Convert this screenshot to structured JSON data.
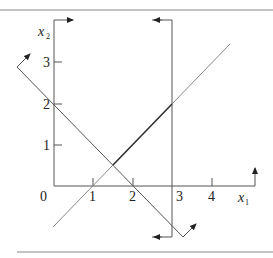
{
  "figure": {
    "type": "linear-programming-feasibility-diagram",
    "axes": {
      "x_label": "x",
      "x_label_sub": "1",
      "y_label": "x",
      "y_label_sub": "2",
      "origin_label": "0",
      "x_ticks": [
        "1",
        "2",
        "3",
        "4"
      ],
      "y_ticks": [
        "1",
        "2",
        "3"
      ]
    },
    "constraints": [
      {
        "name": "x1 + x2 >= 2",
        "points": [
          [
            -1,
            3
          ],
          [
            3.2,
            -1.2
          ]
        ],
        "arrow_side": "upper-right"
      },
      {
        "name": "x1 <= 3",
        "points": [
          [
            3,
            4
          ],
          [
            3,
            -1.2
          ]
        ],
        "arrow_side": "left"
      },
      {
        "name": "x2 >= x1 - 1",
        "points": [
          [
            0,
            -1
          ],
          [
            4.4,
            3.5
          ]
        ],
        "arrow_side": "none"
      },
      {
        "name": "x1 >= 0",
        "arrow_side": "right"
      },
      {
        "name": "x2 >= 0",
        "arrow_side": "up"
      }
    ],
    "highlighted_segment": {
      "from": [
        1.5,
        0.5
      ],
      "to": [
        3,
        2
      ]
    },
    "colors": {
      "line": "#555555",
      "highlight": "#333333",
      "rule": "#888888"
    }
  }
}
